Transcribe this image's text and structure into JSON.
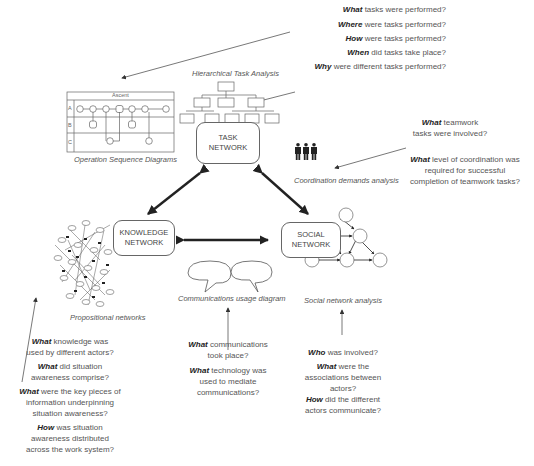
{
  "task_questions": [
    {
      "lead": "What",
      "rest": " tasks were performed?"
    },
    {
      "lead": "Where",
      "rest": " were tasks performed?"
    },
    {
      "lead": "How",
      "rest": " were tasks performed?"
    },
    {
      "lead": "When",
      "rest": " did tasks take place?"
    },
    {
      "lead": "Why",
      "rest": " were different tasks performed?"
    }
  ],
  "captions": {
    "hta": "Hierarchical Task Analysis",
    "osd": "Operation Sequence Diagrams",
    "cda": "Coordination demands analysis",
    "prop": "Propositional networks",
    "comm": "Communications usage diagram",
    "sna": "Social network analysis"
  },
  "osd": {
    "header": "Ascent",
    "rows": [
      "A",
      "B",
      "C"
    ]
  },
  "nodes": {
    "task": [
      "TASK",
      "NETWORK"
    ],
    "knowledge": [
      "KNOWLEDGE",
      "NETWORK"
    ],
    "social": [
      "SOCIAL",
      "NETWORK"
    ]
  },
  "coordination_questions": [
    {
      "lead": "What",
      "lines": [
        " teamwork",
        "tasks were involved?"
      ]
    },
    {
      "lead": "What",
      "lines": [
        " level of coordination was",
        "required for successful",
        "completion of teamwork tasks?"
      ]
    }
  ],
  "knowledge_questions": [
    {
      "lead": "What",
      "lines": [
        " knowledge was",
        "used by different actors?"
      ]
    },
    {
      "lead": "What",
      "lines": [
        " did situation",
        "awareness comprise?"
      ]
    },
    {
      "lead": "What",
      "lines": [
        " were the key pieces of",
        "information underpinning",
        "situation awareness?"
      ]
    },
    {
      "lead": "How",
      "lines": [
        " was situation",
        "awareness distributed",
        "across the work system?"
      ]
    }
  ],
  "comm_questions": [
    {
      "lead": "What",
      "lines": [
        " communications",
        "took place?"
      ]
    },
    {
      "lead": "What",
      "lines": [
        " technology was",
        "used to mediate",
        "communications?"
      ]
    }
  ],
  "social_questions": [
    {
      "lead": "Who",
      "lines": [
        " was involved?"
      ]
    },
    {
      "lead": "What",
      "lines": [
        " were the",
        "associations between",
        "actors?"
      ]
    },
    {
      "lead": "How",
      "lines": [
        " did the different",
        "actors communicate?"
      ]
    }
  ]
}
